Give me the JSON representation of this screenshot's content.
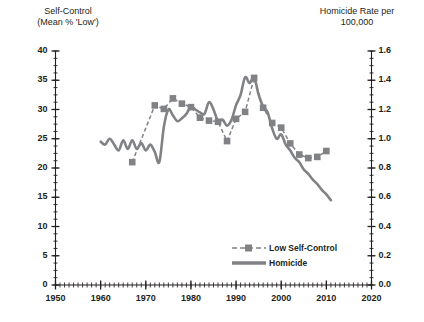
{
  "chart_data": {
    "type": "line",
    "title": "",
    "xlabel": "",
    "ylabel": "Self-Control\n(Mean % 'Low')",
    "y2label": "Homicide Rate per\n100,000",
    "xlim": [
      1950,
      2020
    ],
    "ylim": [
      0,
      40
    ],
    "y2lim": [
      0.0,
      1.6
    ],
    "grid": false,
    "legend_position": "inside-lower-right",
    "x_ticks": [
      "1950",
      "1960",
      "1970",
      "1980",
      "1990",
      "2000",
      "2010",
      "2020"
    ],
    "x_tick_values": [
      1950,
      1960,
      1970,
      1980,
      1990,
      2000,
      2010,
      2020
    ],
    "y_ticks": [
      "0",
      "5",
      "10",
      "15",
      "20",
      "25",
      "30",
      "35",
      "40"
    ],
    "y_tick_values": [
      0,
      5,
      10,
      15,
      20,
      25,
      30,
      35,
      40
    ],
    "y2_ticks": [
      "0.0",
      "0.2",
      "0.4",
      "0.6",
      "0.8",
      "1.0",
      "1.2",
      "1.4",
      "1.6"
    ],
    "y2_tick_values": [
      0.0,
      0.2,
      0.4,
      0.6,
      0.8,
      1.0,
      1.2,
      1.4,
      1.6
    ],
    "minor_tick_interval_x": 1,
    "minor_tick_interval_y": 1.25,
    "series": [
      {
        "name": "Low Self-Control",
        "axis": "left",
        "style": "dashed",
        "marker": "square",
        "color": "#808285",
        "x": [
          1967,
          1972,
          1974,
          1976,
          1978,
          1980,
          1982,
          1984,
          1986,
          1988,
          1990,
          1992,
          1994,
          1996,
          1998,
          2000,
          2002,
          2004,
          2006,
          2008,
          2010
        ],
        "y": [
          21.0,
          30.7,
          30.1,
          31.9,
          31.0,
          30.4,
          28.6,
          28.1,
          27.9,
          24.6,
          28.4,
          29.6,
          35.4,
          30.3,
          27.7,
          26.9,
          24.2,
          22.3,
          21.7,
          21.9,
          22.9
        ]
      },
      {
        "name": "Homicide",
        "axis": "right",
        "style": "solid",
        "marker": "none",
        "color": "#808285",
        "x": [
          1960,
          1961,
          1962,
          1963,
          1964,
          1965,
          1966,
          1967,
          1968,
          1969,
          1970,
          1971,
          1972,
          1973,
          1974,
          1975,
          1976,
          1977,
          1978,
          1979,
          1980,
          1981,
          1982,
          1983,
          1984,
          1985,
          1986,
          1987,
          1988,
          1989,
          1990,
          1991,
          1992,
          1993,
          1994,
          1995,
          1996,
          1997,
          1998,
          1999,
          2000,
          2001,
          2002,
          2003,
          2004,
          2005,
          2006,
          2007,
          2008,
          2009,
          2010,
          2011
        ],
        "y": [
          0.98,
          0.96,
          1.0,
          0.96,
          0.92,
          0.99,
          0.93,
          0.99,
          0.93,
          0.97,
          0.92,
          0.96,
          0.91,
          0.84,
          1.08,
          1.2,
          1.16,
          1.12,
          1.14,
          1.17,
          1.22,
          1.2,
          1.18,
          1.17,
          1.25,
          1.2,
          1.12,
          1.13,
          1.09,
          1.13,
          1.23,
          1.3,
          1.42,
          1.38,
          1.42,
          1.3,
          1.22,
          1.18,
          1.07,
          1.0,
          1.03,
          0.96,
          0.92,
          0.87,
          0.84,
          0.79,
          0.76,
          0.72,
          0.69,
          0.65,
          0.62,
          0.58
        ]
      }
    ],
    "colors": {
      "series": "#808285",
      "axis": "#231f20",
      "text": "#231f20",
      "background": "#ffffff"
    }
  },
  "legend": {
    "items": [
      {
        "label": "Low Self-Control"
      },
      {
        "label": "Homicide"
      }
    ]
  }
}
